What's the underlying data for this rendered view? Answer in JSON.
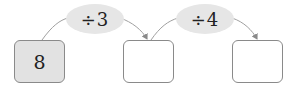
{
  "diagram": {
    "type": "operation-chain",
    "boxes": [
      {
        "value": "8",
        "filled": true
      },
      {
        "value": "",
        "filled": false
      },
      {
        "value": "",
        "filled": false
      }
    ],
    "operations": [
      {
        "label": "÷3",
        "from": 0,
        "to": 1
      },
      {
        "label": "÷4",
        "from": 1,
        "to": 2
      }
    ],
    "colors": {
      "box_border": "#8a8a8a",
      "filled_box": "#e2e2e2",
      "oval": "#e6e6e6",
      "arrow": "#8a8a8a"
    }
  }
}
